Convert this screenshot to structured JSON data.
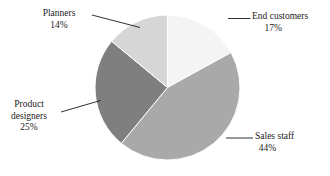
{
  "chart_data": {
    "type": "pie",
    "title": "",
    "subtitle": "",
    "xlabel": "",
    "ylabel": "",
    "legend_position": "none",
    "grid": false,
    "labels_outside": true,
    "start_angle_deg": 0,
    "direction": "clockwise",
    "categories": [
      "End customers",
      "Sales staff",
      "Product designers",
      "Planners"
    ],
    "values": [
      17,
      44,
      25,
      14
    ],
    "value_unit": "%",
    "slices": [
      {
        "name": "End customers",
        "value": 17,
        "value_label": "17%",
        "color": "#f4f4f4",
        "start_deg": 0.0,
        "end_deg": 61.2
      },
      {
        "name": "Sales staff",
        "value": 44,
        "value_label": "44%",
        "color": "#a9a9a9",
        "start_deg": 61.2,
        "end_deg": 219.6
      },
      {
        "name": "Product designers",
        "value": 25,
        "value_label": "25%",
        "color": "#7f7f7f",
        "start_deg": 219.6,
        "end_deg": 309.6
      },
      {
        "name": "Planners",
        "value": 14,
        "value_label": "14%",
        "color": "#d6d6d6",
        "start_deg": 309.6,
        "end_deg": 360.0
      }
    ]
  },
  "labels": {
    "end_customers": {
      "name": "End customers",
      "value": "17%"
    },
    "sales_staff": {
      "name": "Sales staff",
      "value": "44%"
    },
    "product_designers_line1": "Product",
    "product_designers_line2": "designers",
    "product_designers_value": "25%",
    "planners": {
      "name": "Planners",
      "value": "14%"
    }
  },
  "style": {
    "background": "#ffffff",
    "text_color": "#1a1a1a",
    "leader_line_color": "#1a1a1a",
    "slice_border_color": "#ffffff"
  }
}
